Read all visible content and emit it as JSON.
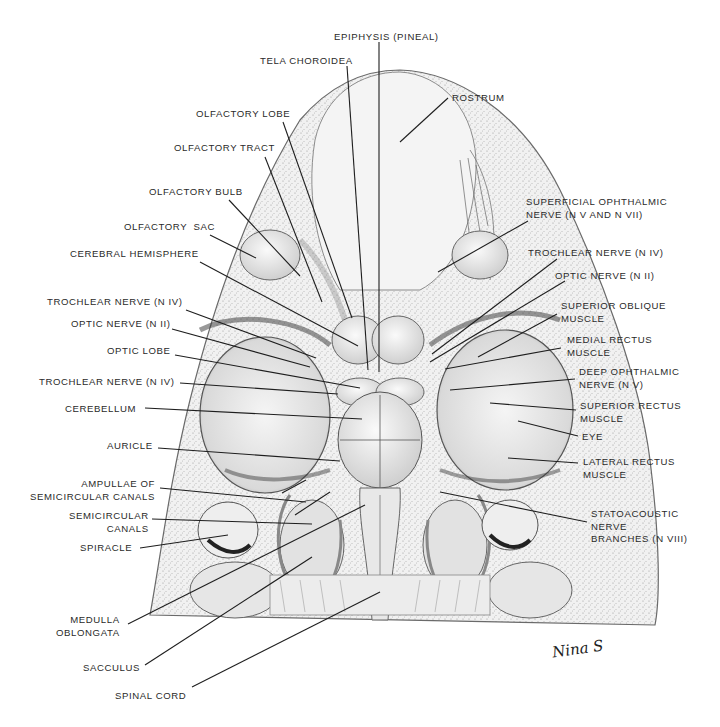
{
  "figure": {
    "signature": "Nina S"
  },
  "labels": [
    {
      "id": "epiphysis",
      "text": "EPIPHYSIS (PINEAL)",
      "x": 334,
      "y": 31,
      "align": "left",
      "line": [
        379,
        42,
        379,
        372
      ]
    },
    {
      "id": "tela-choroidea",
      "text": "TELA CHOROIDEA",
      "x": 260,
      "y": 55,
      "align": "left",
      "line": [
        347,
        66,
        368,
        370
      ]
    },
    {
      "id": "olfactory-lobe",
      "text": "OLFACTORY LOBE",
      "x": 196,
      "y": 108,
      "align": "left",
      "line": [
        283,
        122,
        352,
        318
      ]
    },
    {
      "id": "olfactory-tract",
      "text": "OLFACTORY TRACT",
      "x": 174,
      "y": 142,
      "align": "left",
      "line": [
        265,
        157,
        322,
        302
      ]
    },
    {
      "id": "olfactory-bulb",
      "text": "OLFACTORY BULB",
      "x": 149,
      "y": 186,
      "align": "left",
      "line": [
        229,
        200,
        300,
        276
      ]
    },
    {
      "id": "olfactory-sac",
      "text": "OLFACTORY  SAC",
      "x": 124,
      "y": 221,
      "align": "left",
      "line": [
        210,
        235,
        256,
        258
      ]
    },
    {
      "id": "cerebral-hemisphere",
      "text": "CEREBRAL HEMISPHERE",
      "x": 70,
      "y": 248,
      "align": "left",
      "line": [
        200,
        262,
        358,
        346
      ]
    },
    {
      "id": "trochlear-nerve-left-1",
      "text": "TROCHLEAR NERVE (N IV)",
      "x": 47,
      "y": 296,
      "align": "left",
      "line": [
        186,
        310,
        316,
        358
      ]
    },
    {
      "id": "optic-nerve-left",
      "text": "OPTIC NERVE (N II)",
      "x": 71,
      "y": 318,
      "align": "left",
      "line": [
        172,
        329,
        310,
        367
      ]
    },
    {
      "id": "optic-lobe",
      "text": "OPTIC LOBE",
      "x": 107,
      "y": 345,
      "align": "left",
      "line": [
        175,
        355,
        360,
        388
      ]
    },
    {
      "id": "trochlear-nerve-left-2",
      "text": "TROCHLEAR NERVE (N IV)",
      "x": 39,
      "y": 376,
      "align": "left",
      "line": [
        180,
        383,
        338,
        394
      ]
    },
    {
      "id": "cerebellum",
      "text": "CEREBELLUM",
      "x": 65,
      "y": 403,
      "align": "left",
      "line": [
        145,
        408,
        362,
        419
      ]
    },
    {
      "id": "auricle",
      "text": "AURICLE",
      "x": 107,
      "y": 440,
      "align": "left",
      "line": [
        158,
        448,
        340,
        461
      ]
    },
    {
      "id": "ampullae",
      "text": "AMPULLAE OF\nSEMICIRCULAR CANALS",
      "x": 30,
      "y": 478,
      "align": "right",
      "line": [
        160,
        488,
        306,
        502
      ],
      "line2": [
        282,
        493,
        306,
        480
      ]
    },
    {
      "id": "semicircular-canals",
      "text": "SEMICIRCULAR\nCANALS",
      "x": 69,
      "y": 510,
      "align": "right",
      "line": [
        152,
        519,
        312,
        524
      ],
      "line2": [
        295,
        515,
        330,
        492
      ]
    },
    {
      "id": "spiracle",
      "text": "SPIRACLE",
      "x": 80,
      "y": 542,
      "align": "left",
      "line": [
        140,
        548,
        228,
        535
      ]
    },
    {
      "id": "medulla-oblongata",
      "text": "MEDULLA\nOBLONGATA",
      "x": 56,
      "y": 614,
      "align": "right",
      "line": [
        128,
        624,
        365,
        505
      ]
    },
    {
      "id": "sacculus",
      "text": "SACCULUS",
      "x": 83,
      "y": 662,
      "align": "left",
      "line": [
        145,
        665,
        312,
        557
      ]
    },
    {
      "id": "spinal-cord",
      "text": "SPINAL CORD",
      "x": 115,
      "y": 690,
      "align": "left",
      "line": [
        192,
        687,
        380,
        592
      ]
    },
    {
      "id": "rostrum",
      "text": "ROSTRUM",
      "x": 452,
      "y": 92,
      "align": "left",
      "line": [
        448,
        98,
        400,
        142
      ]
    },
    {
      "id": "superficial-ophthalmic",
      "text": "SUPERFICIAL OPHTHALMIC\nNERVE (N V AND N VII)",
      "x": 526,
      "y": 196,
      "align": "left",
      "line": [
        528,
        221,
        438,
        272
      ]
    },
    {
      "id": "trochlear-nerve-right",
      "text": "TROCHLEAR NERVE (N IV)",
      "x": 528,
      "y": 247,
      "align": "left",
      "line": [
        557,
        259,
        432,
        354
      ]
    },
    {
      "id": "optic-nerve-right",
      "text": "OPTIC NERVE (N II)",
      "x": 555,
      "y": 270,
      "align": "left",
      "line": [
        565,
        281,
        430,
        362
      ]
    },
    {
      "id": "superior-oblique",
      "text": "SUPERIOR OBLIQUE\nMUSCLE",
      "x": 561,
      "y": 300,
      "align": "left",
      "line": [
        557,
        314,
        478,
        357
      ]
    },
    {
      "id": "medial-rectus",
      "text": "MEDIAL RECTUS\nMUSCLE",
      "x": 567,
      "y": 334,
      "align": "left",
      "line": [
        561,
        348,
        445,
        369
      ]
    },
    {
      "id": "deep-ophthalmic",
      "text": "DEEP OPHTHALMIC\nNERVE (N V)",
      "x": 579,
      "y": 366,
      "align": "left",
      "line": [
        575,
        379,
        450,
        390
      ]
    },
    {
      "id": "superior-rectus",
      "text": "SUPERIOR RECTUS\nMUSCLE",
      "x": 580,
      "y": 400,
      "align": "left",
      "line": [
        576,
        410,
        490,
        403
      ]
    },
    {
      "id": "eye",
      "text": "EYE",
      "x": 582,
      "y": 431,
      "align": "left",
      "line": [
        578,
        436,
        518,
        421
      ]
    },
    {
      "id": "lateral-rectus",
      "text": "LATERAL RECTUS\nMUSCLE",
      "x": 583,
      "y": 456,
      "align": "left",
      "line": [
        578,
        463,
        508,
        458
      ]
    },
    {
      "id": "statoacoustic",
      "text": "STATOACOUSTIC\nNERVE\nBRANCHES (N VIII)",
      "x": 591,
      "y": 508,
      "align": "left",
      "line": [
        587,
        522,
        440,
        492
      ]
    }
  ]
}
